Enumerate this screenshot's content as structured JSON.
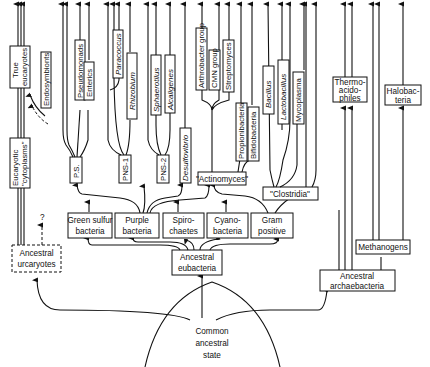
{
  "diagram": {
    "type": "phylogenetic-tree",
    "root": {
      "line1": "Common",
      "line2": "ancestral",
      "line3": "state"
    },
    "kingdoms": {
      "urcaryotes": {
        "line1": "Ancestral",
        "line2": "urcaryotes",
        "question_mark": "?"
      },
      "eubacteria": {
        "line1": "Ancestral",
        "line2": "eubacteria"
      },
      "archaebacteria": {
        "line1": "Ancestral",
        "line2": "archaebacteria"
      }
    },
    "eukaryote_branch": {
      "cytoplasms": {
        "line1": "Eucaryotic",
        "line2": "\"cytoplasms\""
      },
      "true_eucaryotes": {
        "line1": "True",
        "line2": "eucaryotes"
      },
      "endosymbionts": "Endosymbionts"
    },
    "eubacteria_groups": {
      "green_sulfur": {
        "line1": "Green sulfur",
        "line2": "bacteria"
      },
      "purple": {
        "line1": "Purple",
        "line2": "bacteria"
      },
      "spirochaetes": {
        "line1": "Spiro-",
        "line2": "chaetes"
      },
      "cyanobacteria": {
        "line1": "Cyano-",
        "line2": "bacteria"
      },
      "gram_positive": {
        "line1": "Gram",
        "line2": "positive"
      }
    },
    "purple_subgroups": {
      "ps": "P.S.",
      "pns1": "PNS-1",
      "pns2": "PNS-2",
      "desulfovibrio": "Desulfovibrio"
    },
    "ps_leaves": {
      "pseudomonads": "Pseudomonads",
      "enterics": "Enterics"
    },
    "pns1_leaves": {
      "paracoccus": "Paracoccus",
      "rhizobium": "Rhizobium"
    },
    "pns2_leaves": {
      "sphaerotilus": "Sphaerotilus",
      "alcaligenes": "Alcaligenes"
    },
    "gram_positive_subgroups": {
      "actinomyces": "\"Actinomyces\"",
      "clostridia": "\"Clostridia\""
    },
    "actinomyces_leaves": {
      "arthrobacter": "Arthrobacter group",
      "cmn": "CMN group",
      "streptomyces": "Streptomyces",
      "propionibacteria": "Propionibacteria",
      "bifidobacteria": "Bifidobacteria"
    },
    "clostridia_leaves": {
      "bacillus": "Bacillus",
      "lactobacillus": "Lactobacillus",
      "mycoplasma": "Mycoplasma"
    },
    "archaebacteria_groups": {
      "methanogens": "Methanogens",
      "thermoacidophiles": {
        "line1": "Thermo-",
        "line2": "acido-",
        "line3": "philes"
      },
      "halobacteria": {
        "line1": "Halobac-",
        "line2": "teria"
      }
    }
  }
}
